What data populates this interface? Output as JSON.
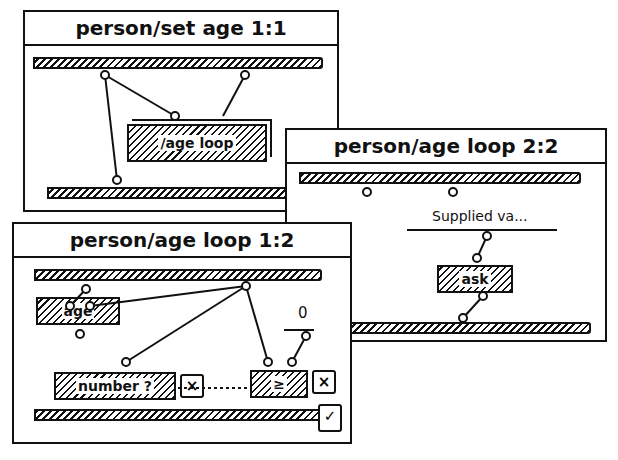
{
  "windows": {
    "set_age": {
      "title": "person/set age 1:1",
      "operations": [
        {
          "label": "/age loop",
          "type": "loop"
        }
      ]
    },
    "age_loop_2": {
      "title": "person/age loop 2:2",
      "input_label": "Supplied va...",
      "operations": [
        {
          "label": "ask"
        }
      ]
    },
    "age_loop_1": {
      "title": "person/age loop 1:2",
      "constant": "0",
      "operations": [
        {
          "label": "age"
        },
        {
          "label": "number ?"
        },
        {
          "label": "≥"
        }
      ],
      "fail_marks": [
        "×",
        "×"
      ],
      "checkmark": "✓"
    }
  }
}
